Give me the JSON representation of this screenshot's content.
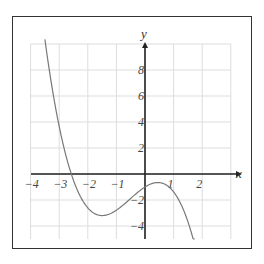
{
  "chart_data": {
    "type": "line",
    "title": "",
    "xlabel": "x",
    "ylabel": "y",
    "xlim": [
      -4,
      3.2
    ],
    "ylim": [
      -5,
      10
    ],
    "x_ticks": [
      -4,
      -3,
      -2,
      -1,
      1,
      2
    ],
    "x_tick_labels": [
      "−4",
      "−3",
      "−2",
      "−1",
      "1",
      "2"
    ],
    "y_ticks": [
      -4,
      -2,
      2,
      4,
      6,
      8
    ],
    "y_tick_labels": [
      "−4",
      "−2",
      "2",
      "4",
      "6",
      "8"
    ],
    "grid": true,
    "grid_x_step": 1,
    "grid_y_step": 2,
    "series": [
      {
        "name": "f(x)",
        "description": "cubic with negative leading coefficient",
        "approx_equation": "y ≈ -0.687x^3 - 1.08x^2 + 1.39x - 1",
        "key_points": {
          "start": [
            -3.5,
            10
          ],
          "x_intercept": [
            -2.65,
            0
          ],
          "local_min": [
            -1.5,
            -3.2
          ],
          "y_intercept": [
            0,
            -1
          ],
          "local_max": [
            0.45,
            -0.65
          ],
          "end": [
            1.75,
            -5
          ]
        },
        "x": [
          -3.5,
          -3.25,
          -3.0,
          -2.75,
          -2.5,
          -2.25,
          -2.0,
          -1.75,
          -1.5,
          -1.25,
          -1.0,
          -0.75,
          -0.5,
          -0.25,
          0.0,
          0.25,
          0.45,
          0.75,
          1.0,
          1.25,
          1.5,
          1.75
        ],
        "y": [
          10.3,
          7.6,
          5.4,
          3.5,
          2.0,
          0.7,
          -0.25,
          -1.0,
          -3.2,
          -3.1,
          -2.8,
          -2.4,
          -1.9,
          -1.4,
          -1.0,
          -0.73,
          -0.65,
          -0.8,
          -1.35,
          -2.2,
          -3.4,
          -5.0
        ]
      }
    ],
    "colors": {
      "curve": "#777777",
      "axes": "#222222",
      "grid": "#dddddd",
      "frame": "#333333"
    }
  }
}
